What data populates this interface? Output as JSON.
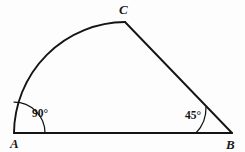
{
  "figure": {
    "background_color": "#fdfdfd",
    "line_color": "#141414",
    "vertices": [
      {
        "id": "A",
        "label": "A",
        "x": 14,
        "y": 133,
        "label_x": 10,
        "label_y": 148
      },
      {
        "id": "B",
        "label": "B",
        "x": 232,
        "y": 133,
        "label_x": 226,
        "label_y": 149
      },
      {
        "id": "C",
        "label": "C",
        "x": 125,
        "y": 22,
        "label_x": 119,
        "label_y": 14
      }
    ],
    "edges": [
      {
        "id": "AB",
        "from": "A",
        "to": "B",
        "type": "straight"
      },
      {
        "id": "CB",
        "from": "C",
        "to": "B",
        "type": "straight"
      },
      {
        "id": "AC",
        "from": "A",
        "to": "C",
        "type": "arc",
        "curvature": "convex-outward"
      }
    ],
    "angles": [
      {
        "id": "angle-A",
        "at": "A",
        "value": 90,
        "label": "90°",
        "label_x": 32,
        "label_y": 117,
        "marker": "arc"
      },
      {
        "id": "angle-B",
        "at": "B",
        "value": 45,
        "label": "45°",
        "label_x": 185,
        "label_y": 119,
        "marker": "arc"
      }
    ]
  }
}
